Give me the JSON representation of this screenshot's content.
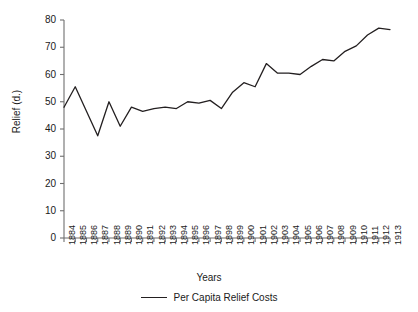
{
  "axes": {
    "ylabel": "Relief (d.)",
    "xlabel": "Years"
  },
  "legend": {
    "entries": [
      {
        "label": "Per Capita Relief Costs",
        "color": "#231f20",
        "marker": "line-swatch"
      }
    ]
  },
  "chart_data": {
    "type": "line",
    "title": "",
    "xlabel": "Years",
    "ylabel": "Relief (d.)",
    "ylim": [
      0,
      80
    ],
    "yticks": [
      0,
      10,
      20,
      30,
      40,
      50,
      60,
      70,
      80
    ],
    "grid": false,
    "legend_position": "bottom-center",
    "line_color": "#231f20",
    "categories": [
      "1884",
      "1885",
      "1886",
      "1887",
      "1888",
      "1889",
      "1890",
      "1891",
      "1892",
      "1893",
      "1894",
      "1895",
      "1896",
      "1897",
      "1898",
      "1899",
      "1900",
      "1901",
      "1902",
      "1903",
      "1904",
      "1905",
      "1906",
      "1907",
      "1908",
      "1909",
      "1910",
      "1911",
      "1912",
      "1913"
    ],
    "series": [
      {
        "name": "Per Capita Relief Costs",
        "values": [
          48.0,
          55.5,
          46.5,
          37.5,
          50.0,
          41.0,
          48.0,
          46.5,
          47.5,
          48.0,
          47.5,
          50.0,
          49.5,
          50.5,
          47.5,
          53.5,
          57.0,
          55.5,
          64.0,
          60.5,
          60.5,
          60.0,
          63.0,
          65.5,
          65.0,
          68.5,
          70.5,
          74.5,
          77.0,
          76.5
        ]
      }
    ]
  }
}
